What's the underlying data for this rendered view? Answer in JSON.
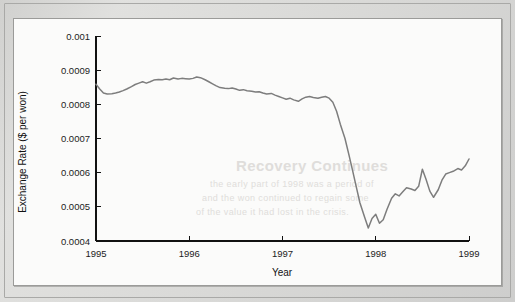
{
  "figure": {
    "background_color": "#fbfbfa",
    "page_color": "#d8d8d6"
  },
  "ghost_text": {
    "heading": "Recovery Continues",
    "line1": "the early part of 1998 was a period of",
    "line2": "and the won continued to regain some",
    "line3": "of the value it had lost in the crisis."
  },
  "chart_data": {
    "type": "line",
    "title": "",
    "xlabel": "Year",
    "ylabel": "Exchange Rate ($ per won)",
    "xlim": [
      1995.0,
      1999.0
    ],
    "ylim": [
      0.0004,
      0.001
    ],
    "grid": false,
    "legend": false,
    "line_color": "#7d7d7d",
    "xticks": [
      "1995",
      "1996",
      "1997",
      "1998",
      "1999"
    ],
    "xtick_values": [
      1995,
      1996,
      1997,
      1998,
      1999
    ],
    "yticks": [
      "0.0004",
      "0.0005",
      "0.0006",
      "0.0007",
      "0.0008",
      "0.0009",
      "0.001"
    ],
    "ytick_values": [
      0.0004,
      0.0005,
      0.0006,
      0.0007,
      0.0008,
      0.0009,
      0.001
    ],
    "series": [
      {
        "name": "Won exchange rate",
        "x": [
          1995.0,
          1995.04,
          1995.08,
          1995.12,
          1995.17,
          1995.21,
          1995.25,
          1995.29,
          1995.33,
          1995.38,
          1995.42,
          1995.46,
          1995.5,
          1995.54,
          1995.58,
          1995.62,
          1995.67,
          1995.71,
          1995.75,
          1995.79,
          1995.83,
          1995.88,
          1995.92,
          1995.96,
          1996.0,
          1996.04,
          1996.08,
          1996.12,
          1996.17,
          1996.21,
          1996.25,
          1996.29,
          1996.33,
          1996.38,
          1996.42,
          1996.46,
          1996.5,
          1996.54,
          1996.58,
          1996.62,
          1996.67,
          1996.71,
          1996.75,
          1996.79,
          1996.83,
          1996.88,
          1996.92,
          1996.96,
          1997.0,
          1997.04,
          1997.08,
          1997.12,
          1997.17,
          1997.21,
          1997.25,
          1997.29,
          1997.33,
          1997.38,
          1997.42,
          1997.46,
          1997.5,
          1997.54,
          1997.58,
          1997.62,
          1997.67,
          1997.71,
          1997.75,
          1997.79,
          1997.83,
          1997.88,
          1997.92,
          1997.96,
          1998.0,
          1998.04,
          1998.08,
          1998.12,
          1998.17,
          1998.21,
          1998.25,
          1998.29,
          1998.33,
          1998.38,
          1998.42,
          1998.46,
          1998.5,
          1998.54,
          1998.58,
          1998.62,
          1998.67,
          1998.71,
          1998.75,
          1998.79,
          1998.83,
          1998.88,
          1998.92,
          1998.96,
          1999.0
        ],
        "y": [
          0.000859,
          0.000845,
          0.000833,
          0.00083,
          0.000831,
          0.000833,
          0.000836,
          0.00084,
          0.000845,
          0.000852,
          0.000858,
          0.000862,
          0.000866,
          0.000862,
          0.000866,
          0.000871,
          0.000873,
          0.000872,
          0.000874,
          0.000872,
          0.000877,
          0.000874,
          0.000876,
          0.000875,
          0.000874,
          0.000876,
          0.00088,
          0.000878,
          0.000872,
          0.000866,
          0.00086,
          0.000854,
          0.000849,
          0.000847,
          0.000846,
          0.000848,
          0.000845,
          0.000841,
          0.000843,
          0.00084,
          0.000838,
          0.000836,
          0.000837,
          0.000833,
          0.00083,
          0.000832,
          0.000827,
          0.000823,
          0.000819,
          0.000815,
          0.000818,
          0.000813,
          0.000809,
          0.000816,
          0.000821,
          0.000823,
          0.00082,
          0.000818,
          0.000821,
          0.000823,
          0.000818,
          0.000806,
          0.00078,
          0.000742,
          0.0007,
          0.000655,
          0.000608,
          0.00056,
          0.000512,
          0.00047,
          0.000438,
          0.000466,
          0.000478,
          0.000452,
          0.000462,
          0.000492,
          0.000525,
          0.000538,
          0.000532,
          0.000544,
          0.000556,
          0.000552,
          0.000548,
          0.00056,
          0.00061,
          0.00058,
          0.000546,
          0.000528,
          0.00055,
          0.000578,
          0.000596,
          0.0006,
          0.000604,
          0.000612,
          0.000608,
          0.00062,
          0.00064
        ]
      }
    ],
    "annotations": {
      "note": "Korean won collapses in late 1997 (Asian financial crisis), troughing near 0.00044, then partially recovers toward 0.00064 by 1999"
    }
  }
}
